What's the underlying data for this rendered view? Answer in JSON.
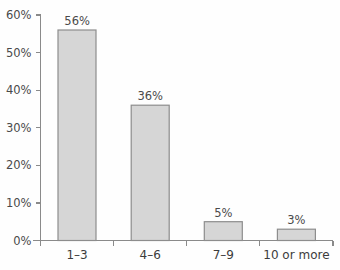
{
  "chart_data": {
    "type": "bar",
    "title": "",
    "subtitle": "",
    "xlabel": "",
    "ylabel": "",
    "categories": [
      "1–3",
      "4–6",
      "7–9",
      "10 or more"
    ],
    "values": [
      56,
      36,
      5,
      3
    ],
    "value_labels": [
      "56%",
      "36%",
      "5%",
      "3%"
    ],
    "ylim": [
      0,
      60
    ],
    "ytick_values": [
      0,
      10,
      20,
      30,
      40,
      50,
      60
    ],
    "ytick_labels": [
      "0%",
      "10%",
      "20%",
      "30%",
      "40%",
      "50%",
      "60%"
    ],
    "grid": false,
    "legend": "none",
    "series": [
      {
        "name": "",
        "values": [
          56,
          36,
          5,
          3
        ]
      }
    ],
    "colors": {
      "bar_fill": "#d6d6d6",
      "bar_stroke": "#8d8d8d",
      "axis": "#8a8a8a",
      "text": "#4a4a4a",
      "background": "#fefefe"
    }
  }
}
